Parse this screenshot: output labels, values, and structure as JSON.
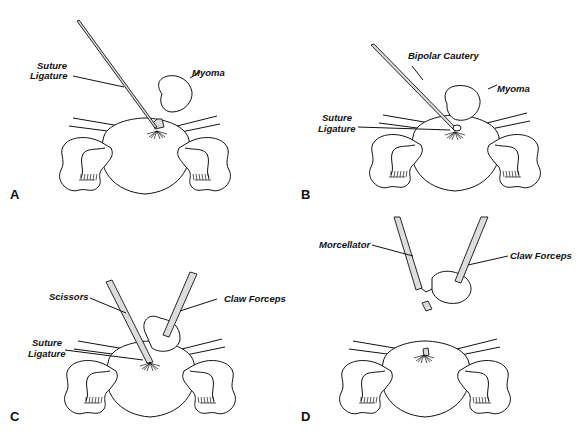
{
  "figure": {
    "panels": [
      {
        "id": "A",
        "label": "A",
        "callouts": [
          "Suture",
          "Ligature",
          "Myoma"
        ]
      },
      {
        "id": "B",
        "label": "B",
        "callouts": [
          "Bipolar Cautery",
          "Myoma",
          "Suture",
          "Ligature"
        ]
      },
      {
        "id": "C",
        "label": "C",
        "callouts": [
          "Scissors",
          "Claw Forceps",
          "Suture",
          "Ligature"
        ]
      },
      {
        "id": "D",
        "label": "D",
        "callouts": [
          "Morcellator",
          "Claw Forceps"
        ]
      }
    ]
  }
}
